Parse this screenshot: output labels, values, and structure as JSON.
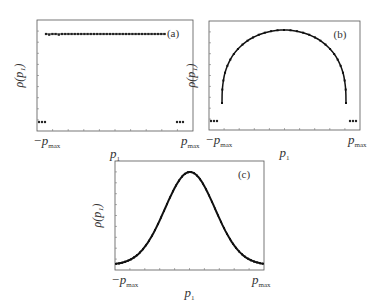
{
  "figure": {
    "panels": [
      {
        "id": "a",
        "tag": "(a)",
        "ylabel": "ρ(p₁)",
        "xlabel": "p₁",
        "xmin_label": "−p",
        "xmax_label": "p",
        "sub": "max",
        "label_sub": "1"
      },
      {
        "id": "b",
        "tag": "(b)",
        "ylabel": "ρ(p₁)",
        "xlabel": "p₁",
        "xmin_label": "−p",
        "xmax_label": "p",
        "sub": "max",
        "label_sub": "1"
      },
      {
        "id": "c",
        "tag": "(c)",
        "ylabel": "ρ(p₁)",
        "xlabel": "p₁",
        "xmin_label": "−p",
        "xmax_label": "p",
        "sub": "max",
        "label_sub": "1"
      }
    ]
  },
  "chart_data": [
    {
      "type": "scatter",
      "title": "(a)",
      "xlabel": "p_1",
      "ylabel": "ρ(p_1)",
      "x_tick_labels": [
        "-p_max",
        "p_max"
      ],
      "description": "Uniform (flat) distribution across interior; near-zero values at outer edges",
      "x": [
        -1.0,
        -0.95,
        -0.9,
        -0.85,
        -0.8,
        -0.6,
        -0.4,
        -0.2,
        0.0,
        0.2,
        0.4,
        0.6,
        0.8,
        0.85,
        0.9,
        0.95,
        1.0
      ],
      "y": [
        0.0,
        0.0,
        0.0,
        1.0,
        1.0,
        1.0,
        1.0,
        1.0,
        1.0,
        1.0,
        1.0,
        1.0,
        1.0,
        0.0,
        0.0,
        0.0,
        0.0
      ],
      "xlim": [
        -1,
        1
      ],
      "ylim": [
        -0.1,
        1.15
      ],
      "grid": false
    },
    {
      "type": "line",
      "title": "(b)",
      "xlabel": "p_1",
      "ylabel": "ρ(p_1)",
      "x_tick_labels": [
        "-p_max",
        "p_max"
      ],
      "description": "Semicircle-shaped distribution with zero values near edges",
      "x": [
        -1.0,
        -0.95,
        -0.85,
        -0.8,
        -0.6,
        -0.4,
        -0.2,
        0.0,
        0.2,
        0.4,
        0.6,
        0.8,
        0.85,
        0.95,
        1.0
      ],
      "y": [
        0.0,
        0.0,
        0.0,
        0.38,
        0.72,
        0.88,
        0.97,
        1.0,
        0.97,
        0.88,
        0.72,
        0.38,
        0.0,
        0.0,
        0.0
      ],
      "xlim": [
        -1,
        1
      ],
      "ylim": [
        -0.1,
        1.1
      ],
      "grid": false
    },
    {
      "type": "line",
      "title": "(c)",
      "xlabel": "p_1",
      "ylabel": "ρ(p_1)",
      "x_tick_labels": [
        "-p_max",
        "p_max"
      ],
      "description": "Gaussian-like bell-shaped distribution centered at 0",
      "x": [
        -1.0,
        -0.8,
        -0.6,
        -0.4,
        -0.2,
        0.0,
        0.2,
        0.4,
        0.6,
        0.8,
        1.0
      ],
      "y": [
        0.02,
        0.05,
        0.2,
        0.5,
        0.85,
        1.0,
        0.85,
        0.5,
        0.2,
        0.05,
        0.02
      ],
      "xlim": [
        -1,
        1
      ],
      "ylim": [
        -0.05,
        1.1
      ],
      "grid": false
    }
  ]
}
